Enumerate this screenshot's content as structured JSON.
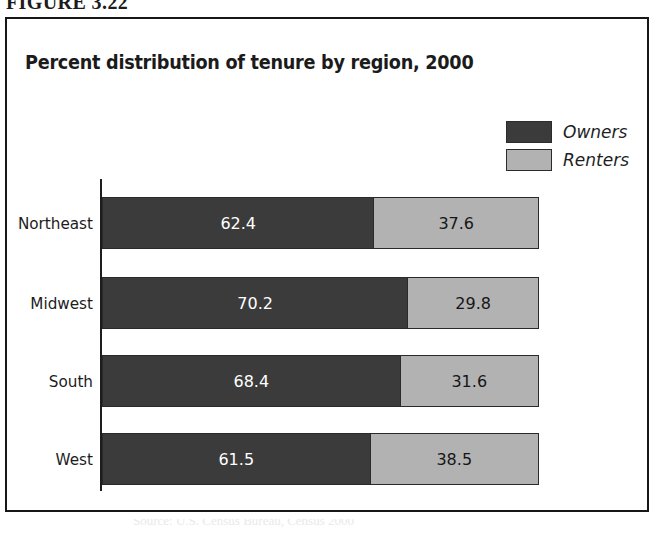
{
  "figure": {
    "number_label": "FIGURE 3.22",
    "source_caption": "Source: U.S. Census Bureau, Census 2000"
  },
  "chart_data": {
    "type": "bar",
    "orientation": "horizontal",
    "stacked": true,
    "normalized_percent": true,
    "title": "Percent distribution of tenure by region, 2000",
    "xlabel": "",
    "ylabel": "",
    "xlim": [
      0,
      100
    ],
    "grid": false,
    "legend_position": "top-right",
    "categories": [
      "Northeast",
      "Midwest",
      "South",
      "West"
    ],
    "series": [
      {
        "name": "Owners",
        "color": "#3b3b3b",
        "values": [
          62.4,
          70.2,
          68.4,
          61.5
        ]
      },
      {
        "name": "Renters",
        "color": "#b2b2b2",
        "values": [
          37.6,
          29.8,
          31.6,
          38.5
        ]
      }
    ],
    "rows": [
      {
        "category": "Northeast",
        "owners": 62.4,
        "renters": 37.6,
        "owners_text": "62.4",
        "renters_text": "37.6"
      },
      {
        "category": "Midwest",
        "owners": 70.2,
        "renters": 29.8,
        "owners_text": "70.2",
        "renters_text": "29.8"
      },
      {
        "category": "South",
        "owners": 68.4,
        "renters": 31.6,
        "owners_text": "68.4",
        "renters_text": "31.6"
      },
      {
        "category": "West",
        "owners": 61.5,
        "renters": 38.5,
        "owners_text": "61.5",
        "renters_text": "38.5"
      }
    ],
    "legend": [
      {
        "label": "Owners",
        "color": "#3b3b3b"
      },
      {
        "label": "Renters",
        "color": "#b2b2b2"
      }
    ]
  },
  "colors": {
    "owners": "#3b3b3b",
    "renters": "#b2b2b2",
    "frame": "#171717",
    "text": "#1c1c1c",
    "value_on_dark": "#ffffff",
    "value_on_light": "#161616"
  }
}
